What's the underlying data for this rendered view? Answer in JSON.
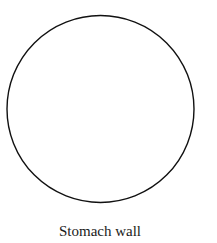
{
  "diagram": {
    "shape": "circle",
    "stroke_color": "#111111",
    "fill_color": "#ffffff",
    "label": "Stomach wall"
  }
}
